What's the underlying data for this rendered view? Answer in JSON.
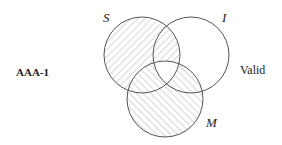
{
  "diagram": {
    "type": "venn",
    "form_label": "AAA-1",
    "result": "Valid",
    "sets": [
      {
        "name": "S",
        "cx": 142,
        "cy": 55,
        "r": 38
      },
      {
        "name": "I",
        "cx": 191,
        "cy": 55,
        "r": 38
      },
      {
        "name": "M",
        "cx": 165,
        "cy": 99,
        "r": 38
      }
    ],
    "shading": {
      "S_only": "hatched-backslash",
      "S_and_I_not_M": "hatched-backslash",
      "S_and_M_not_I": "hatched-slash",
      "M_only": "hatched-slash",
      "M_and_I_not_S": "hatched-slash",
      "S_and_I_and_M": "none",
      "I_only": "none"
    },
    "colors": {
      "stroke": "#555555",
      "hatch": "#9a9a9a"
    }
  }
}
